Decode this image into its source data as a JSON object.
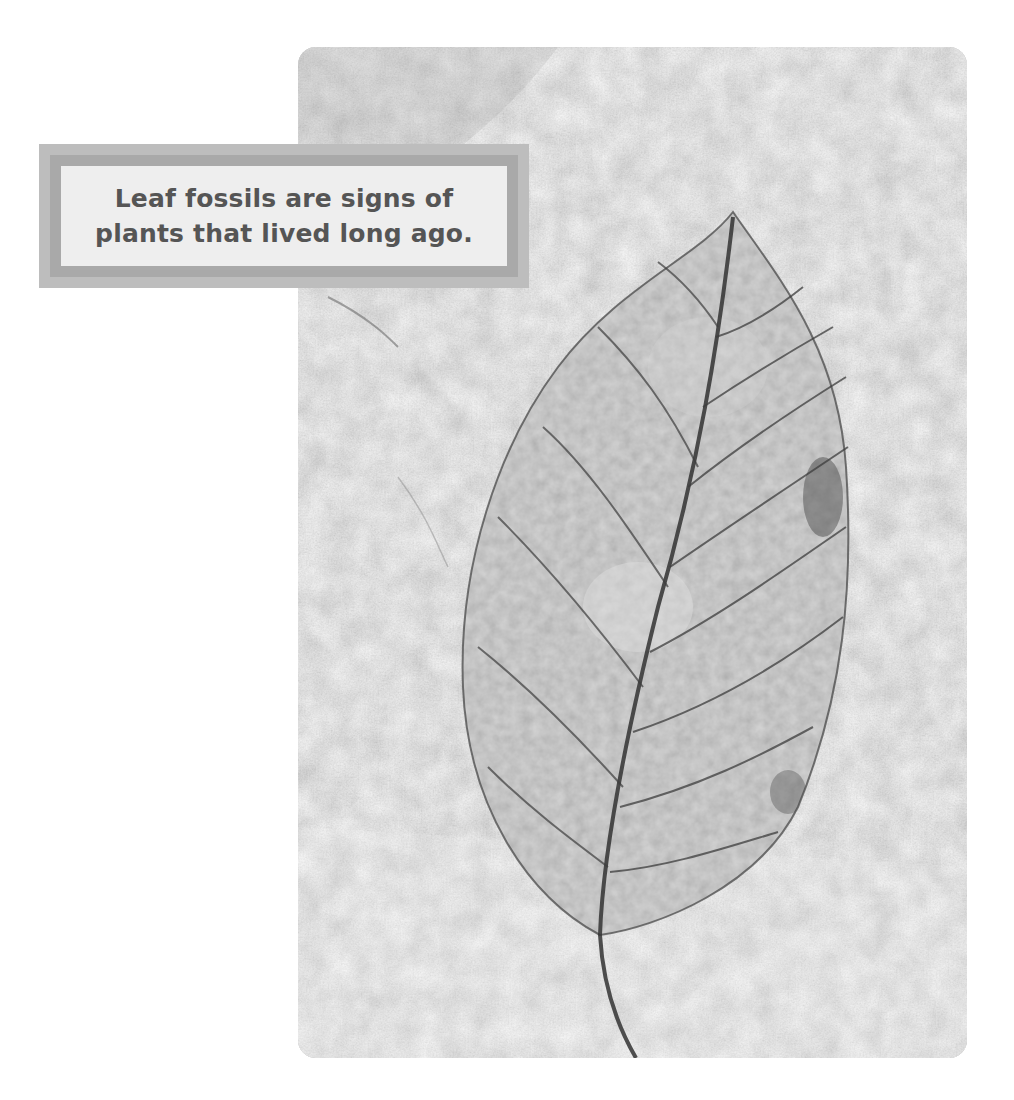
{
  "caption": {
    "lines": [
      "Leaf fossils are signs of",
      "plants that lived long ago."
    ]
  },
  "photo": {
    "subject": "leaf fossil in stone",
    "colors": {
      "stone_light": "#dcdcdc",
      "stone_mid": "#c4c4c4",
      "stone_dark": "#9a9a9a",
      "leaf_fill": "#a7a7a7",
      "vein": "#3d3d3d"
    }
  },
  "colors": {
    "caption_outer": "#bdbdbd",
    "caption_border": "#a9a9a9",
    "caption_panel": "#eeeeee",
    "caption_text": "#555555",
    "page_background": "#ffffff"
  }
}
